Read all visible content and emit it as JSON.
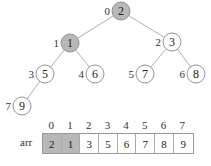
{
  "tree": {
    "nodes": [
      {
        "index": "0",
        "value": "2",
        "x": 121,
        "y": 11,
        "highlight": true
      },
      {
        "index": "1",
        "value": "1",
        "x": 70,
        "y": 43,
        "highlight": true
      },
      {
        "index": "2",
        "value": "3",
        "x": 172,
        "y": 42,
        "highlight": false
      },
      {
        "index": "3",
        "value": "5",
        "x": 45,
        "y": 74,
        "highlight": false
      },
      {
        "index": "4",
        "value": "6",
        "x": 95,
        "y": 74,
        "highlight": false
      },
      {
        "index": "5",
        "value": "7",
        "x": 145,
        "y": 74,
        "highlight": false
      },
      {
        "index": "6",
        "value": "8",
        "x": 196,
        "y": 74,
        "highlight": false
      },
      {
        "index": "7",
        "value": "9",
        "x": 22,
        "y": 106,
        "highlight": false
      }
    ],
    "edges": [
      [
        0,
        1
      ],
      [
        0,
        2
      ],
      [
        1,
        3
      ],
      [
        1,
        4
      ],
      [
        2,
        5
      ],
      [
        2,
        6
      ],
      [
        3,
        7
      ]
    ]
  },
  "array": {
    "name": "arr",
    "indices": [
      "0",
      "1",
      "2",
      "3",
      "4",
      "5",
      "6",
      "7"
    ],
    "values": [
      "2",
      "1",
      "3",
      "5",
      "6",
      "7",
      "8",
      "9"
    ],
    "highlighted": [
      0,
      1
    ]
  },
  "colors": {
    "highlight": "#b8b8b8",
    "stroke": "#888888"
  }
}
